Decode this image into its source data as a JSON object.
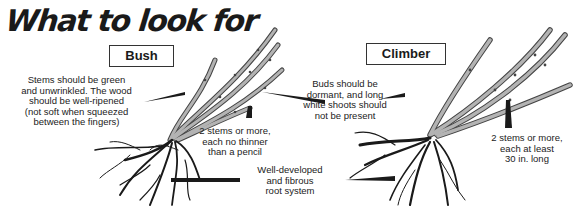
{
  "title": "What to look for",
  "labels": {
    "bush": "Bush",
    "climber": "Climber"
  },
  "notes": {
    "stems_condition": [
      "Stems should be green",
      "and unwrinkled. The wood",
      "should be well-ripened",
      "(not soft when squeezed",
      "between the fingers)"
    ],
    "bush_stems": [
      "2 stems or more,",
      "each no thinner",
      "than a pencil"
    ],
    "buds": [
      "Buds should be",
      "dormant, and long",
      "white shoots should",
      "not be present"
    ],
    "roots": [
      "Well-developed",
      "and fibrous",
      "root system"
    ],
    "climber_stems": [
      "2 stems or more,",
      "each at least",
      "30 in. long"
    ]
  },
  "colors": {
    "stem": "#a9a9a9",
    "stem_outline": "#444444",
    "root": "#1a1a1a",
    "pointer": "#1a1a1a"
  }
}
